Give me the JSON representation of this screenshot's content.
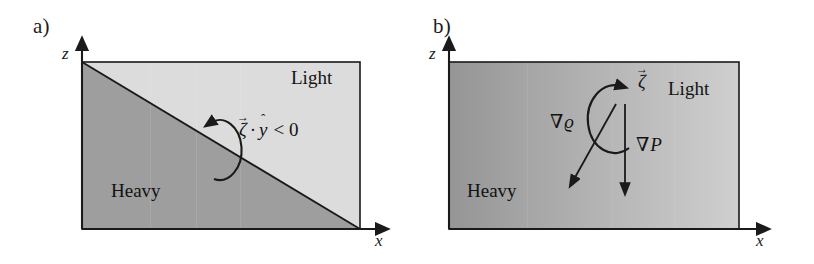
{
  "figure": {
    "type": "diagram",
    "background_color": "#ffffff",
    "ink_color": "#1a1a1a"
  },
  "panels": [
    {
      "id": "a",
      "label": "a)",
      "axes": {
        "z_label": "z",
        "x_label": "x",
        "origin_note": "arrows at top of z axis and right end of x axis"
      },
      "box": {
        "x": 82,
        "y": 62,
        "width": 278,
        "height": 167,
        "border_color": "#1a1a1a",
        "fill_light": "#d9d9d9",
        "fill_heavy": "#9e9e9e"
      },
      "interface": {
        "kind": "diagonal",
        "from": "top-left",
        "to": "bottom-right"
      },
      "regions": [
        {
          "name": "light-region-label",
          "text": "Light",
          "shade": "#d9d9d9"
        },
        {
          "name": "heavy-region-label",
          "text": "Heavy",
          "shade": "#9e9e9e"
        }
      ],
      "vorticity": {
        "sense": "counterclockwise",
        "equation": "ζ̇ · ŷ < 0",
        "symbol": "ζ",
        "dot": "·",
        "unit_vector": "y",
        "relation": "< 0"
      }
    },
    {
      "id": "b",
      "label": "b)",
      "axes": {
        "z_label": "z",
        "x_label": "x",
        "origin_note": "arrows at top of z axis and right end of x axis"
      },
      "box": {
        "x": 42,
        "y": 62,
        "width": 290,
        "height": 167,
        "border_color": "#1a1a1a",
        "gradient_from": "#9a9a9a",
        "gradient_to": "#cccccc"
      },
      "regions": [
        {
          "name": "light-region-label",
          "text": "Light"
        },
        {
          "name": "heavy-region-label",
          "text": "Heavy"
        }
      ],
      "vectors": [
        {
          "name": "density-gradient",
          "symbol": "∇ϱ",
          "direction": "down-left"
        },
        {
          "name": "pressure-gradient",
          "symbol": "∇P",
          "direction": "down"
        }
      ],
      "vorticity": {
        "sense": "counterclockwise",
        "symbol": "ζ",
        "label": "ζ vector"
      }
    }
  ],
  "glyphs": {
    "vec_arrow": "→",
    "hat": "ˆ",
    "nabla": "∇",
    "zeta": "ζ",
    "varrho": "ϱ",
    "cdot": "·",
    "less_than_zero": "< 0",
    "P": "P",
    "y": "y"
  }
}
